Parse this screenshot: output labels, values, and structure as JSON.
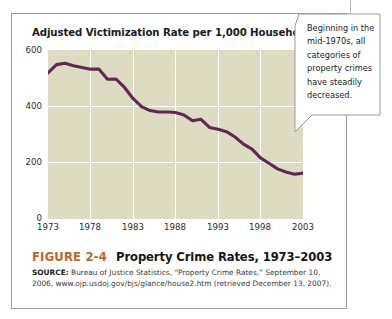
{
  "figure": {
    "number_label": "FIGURE 2-4",
    "title": "Property Crime Rates, 1973–2003",
    "source_bold": "SOURCE:",
    "source_text": " Bureau of Justice Statistics, “Property Crime Rates,” September 10, 2006, www.ojp.usdoj.gov/bjs/glance/house2.htm (retrieved December 13, 2007)."
  },
  "callout": {
    "text": "Beginning in the mid-1970s, all categories of property crimes have steadily decreased."
  },
  "colors": {
    "plot_background": "#dddcc2",
    "line": "#5f2b4d",
    "gridline": "#ffffff",
    "figure_number": "#c4622d",
    "frame_border": "#9a9a9a"
  },
  "chart_data": {
    "type": "line",
    "title": "Adjusted Victimization Rate per 1,000 Households",
    "xlabel": "",
    "ylabel": "Adjusted Victimization Rate per 1,000 Households",
    "xlim": [
      1973,
      2003
    ],
    "ylim": [
      0,
      600
    ],
    "yticks": [
      600,
      400,
      200,
      0
    ],
    "xticks": [
      1973,
      1978,
      1983,
      1988,
      1993,
      1998,
      2003
    ],
    "grid": true,
    "legend": null,
    "series": [
      {
        "name": "Property crime rate per 1,000 households",
        "x": [
          1973,
          1974,
          1975,
          1976,
          1977,
          1978,
          1979,
          1980,
          1981,
          1982,
          1983,
          1984,
          1985,
          1986,
          1987,
          1988,
          1989,
          1990,
          1991,
          1992,
          1993,
          1994,
          1995,
          1996,
          1997,
          1998,
          1999,
          2000,
          2001,
          2002,
          2003
        ],
        "values": [
          519,
          548,
          553,
          544,
          538,
          532,
          532,
          496,
          497,
          467,
          428,
          399,
          385,
          380,
          380,
          378,
          369,
          349,
          354,
          325,
          319,
          310,
          291,
          266,
          248,
          217,
          198,
          178,
          167,
          159,
          163
        ]
      }
    ]
  }
}
